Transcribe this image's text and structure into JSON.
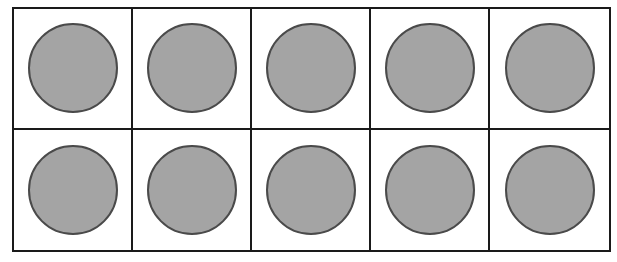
{
  "ten_frame": {
    "rows": 2,
    "columns": 5,
    "filled_count": 10,
    "counter_fill_color": "#a4a4a4",
    "counter_stroke_color": "#4a4a4a",
    "grid_line_color": "#1a1a1a",
    "cells": [
      {
        "row": 1,
        "col": 1,
        "filled": true
      },
      {
        "row": 1,
        "col": 2,
        "filled": true
      },
      {
        "row": 1,
        "col": 3,
        "filled": true
      },
      {
        "row": 1,
        "col": 4,
        "filled": true
      },
      {
        "row": 1,
        "col": 5,
        "filled": true
      },
      {
        "row": 2,
        "col": 1,
        "filled": true
      },
      {
        "row": 2,
        "col": 2,
        "filled": true
      },
      {
        "row": 2,
        "col": 3,
        "filled": true
      },
      {
        "row": 2,
        "col": 4,
        "filled": true
      },
      {
        "row": 2,
        "col": 5,
        "filled": true
      }
    ]
  }
}
